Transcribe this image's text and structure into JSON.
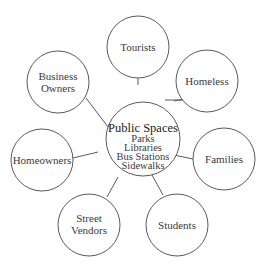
{
  "diagram": {
    "type": "bubble-map",
    "center": {
      "title": "Public Spaces",
      "items": [
        "Parks",
        "Libraries",
        "Bus Stations",
        "Sidewalks"
      ]
    },
    "nodes": [
      {
        "id": "tourists",
        "lines": [
          "Tourists"
        ]
      },
      {
        "id": "homeless",
        "lines": [
          "Homeless"
        ]
      },
      {
        "id": "families",
        "lines": [
          "Families"
        ]
      },
      {
        "id": "students",
        "lines": [
          "Students"
        ]
      },
      {
        "id": "street-vendors",
        "lines": [
          "Street",
          "Vendors"
        ]
      },
      {
        "id": "homeowners",
        "lines": [
          "Homeowners"
        ]
      },
      {
        "id": "business-owners",
        "lines": [
          "Business",
          "Owners"
        ]
      }
    ]
  },
  "colors": {
    "stroke": "#5a5a5a",
    "text": "#3a3a3a",
    "background": "#ffffff"
  }
}
